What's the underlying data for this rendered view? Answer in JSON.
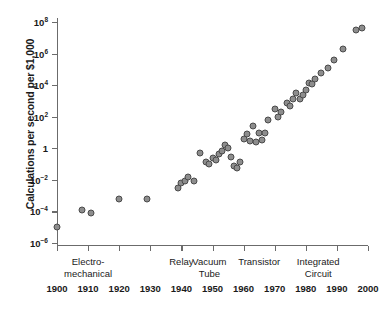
{
  "chart_data": {
    "type": "scatter",
    "title": "",
    "xlabel": "",
    "ylabel": "Calculations per second per $1,000",
    "xlim": [
      1900,
      2000
    ],
    "ylim": [
      -6,
      8
    ],
    "y_scale": "log10",
    "grid": false,
    "legend": null,
    "x_ticks": [
      "1900",
      "1910",
      "1920",
      "1930",
      "1940",
      "1950",
      "1960",
      "1970",
      "1980",
      "1990",
      "2000"
    ],
    "x_tick_values": [
      1900,
      1910,
      1920,
      1930,
      1940,
      1950,
      1960,
      1970,
      1980,
      1990,
      2000
    ],
    "y_ticks": [
      {
        "mantissa": "10",
        "exponent": "8",
        "value": 8
      },
      {
        "mantissa": "10",
        "exponent": "6",
        "value": 6
      },
      {
        "mantissa": "10",
        "exponent": "4",
        "value": 4
      },
      {
        "mantissa": "10",
        "exponent": "2",
        "value": 2
      },
      {
        "mantissa": "1",
        "exponent": "",
        "value": 0
      },
      {
        "mantissa": "10",
        "exponent": "−2",
        "value": -2
      },
      {
        "mantissa": "10",
        "exponent": "−4",
        "value": -4
      },
      {
        "mantissa": "10",
        "exponent": "−6",
        "value": -6
      }
    ],
    "annotations": [
      {
        "label": "Electro-\nmechanical",
        "x": 1910
      },
      {
        "label": "Relay",
        "x": 1940
      },
      {
        "label": "Vacuum\nTube",
        "x": 1949
      },
      {
        "label": "Transistor",
        "x": 1965
      },
      {
        "label": "Integrated\nCircuit",
        "x": 1984
      }
    ],
    "point_color": "#8d8d8d",
    "point_edge_color": "#4a4a4a",
    "points": [
      {
        "x": 1900,
        "y": -5.0
      },
      {
        "x": 1908,
        "y": -3.9
      },
      {
        "x": 1911,
        "y": -4.1
      },
      {
        "x": 1920,
        "y": -3.2
      },
      {
        "x": 1929,
        "y": -3.2
      },
      {
        "x": 1939,
        "y": -2.5
      },
      {
        "x": 1940,
        "y": -2.2
      },
      {
        "x": 1941,
        "y": -2.1
      },
      {
        "x": 1942,
        "y": -1.8
      },
      {
        "x": 1944,
        "y": -2.1
      },
      {
        "x": 1946,
        "y": -0.3
      },
      {
        "x": 1948,
        "y": -0.9
      },
      {
        "x": 1949,
        "y": -1.0
      },
      {
        "x": 1950,
        "y": -0.6
      },
      {
        "x": 1951,
        "y": -0.75
      },
      {
        "x": 1952,
        "y": -0.35
      },
      {
        "x": 1953,
        "y": -0.2
      },
      {
        "x": 1954,
        "y": 0.2
      },
      {
        "x": 1955,
        "y": 0.0
      },
      {
        "x": 1956,
        "y": -0.55
      },
      {
        "x": 1957,
        "y": -1.1
      },
      {
        "x": 1958,
        "y": -1.25
      },
      {
        "x": 1959,
        "y": -0.85
      },
      {
        "x": 1960,
        "y": 0.6
      },
      {
        "x": 1961,
        "y": 0.9
      },
      {
        "x": 1962,
        "y": 0.45
      },
      {
        "x": 1963,
        "y": 1.4
      },
      {
        "x": 1964,
        "y": 0.4
      },
      {
        "x": 1965,
        "y": 1.0
      },
      {
        "x": 1966,
        "y": 0.55
      },
      {
        "x": 1967,
        "y": 1.0
      },
      {
        "x": 1968,
        "y": 1.8
      },
      {
        "x": 1970,
        "y": 2.5
      },
      {
        "x": 1971,
        "y": 2.0
      },
      {
        "x": 1972,
        "y": 2.3
      },
      {
        "x": 1974,
        "y": 2.9
      },
      {
        "x": 1975,
        "y": 2.65
      },
      {
        "x": 1976,
        "y": 3.1
      },
      {
        "x": 1977,
        "y": 3.5
      },
      {
        "x": 1978,
        "y": 3.15
      },
      {
        "x": 1979,
        "y": 3.4
      },
      {
        "x": 1980,
        "y": 3.7
      },
      {
        "x": 1981,
        "y": 4.15
      },
      {
        "x": 1982,
        "y": 4.05
      },
      {
        "x": 1983,
        "y": 4.4
      },
      {
        "x": 1985,
        "y": 4.8
      },
      {
        "x": 1987,
        "y": 5.1
      },
      {
        "x": 1989,
        "y": 5.6
      },
      {
        "x": 1992,
        "y": 6.3
      },
      {
        "x": 1996,
        "y": 7.5
      },
      {
        "x": 1998,
        "y": 7.6
      }
    ]
  }
}
